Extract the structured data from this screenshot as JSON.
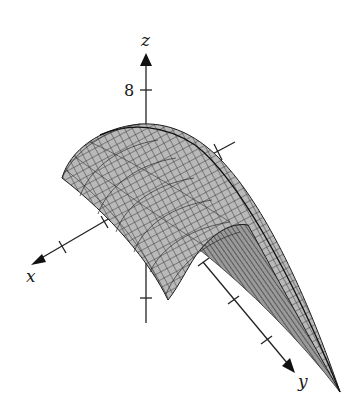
{
  "figure": {
    "type": "3d-surface-plot",
    "axes": {
      "x": {
        "label": "x",
        "ticks": 2
      },
      "y": {
        "label": "y",
        "ticks": 3
      },
      "z": {
        "label": "z",
        "tick_label": "8",
        "ticks": 2
      }
    },
    "surface": {
      "shape": "parabolic-cylinder",
      "fill_color": "#b4b4b4",
      "underside_color": "#8c8c8c",
      "mesh_color": "#2a2a2a"
    }
  }
}
